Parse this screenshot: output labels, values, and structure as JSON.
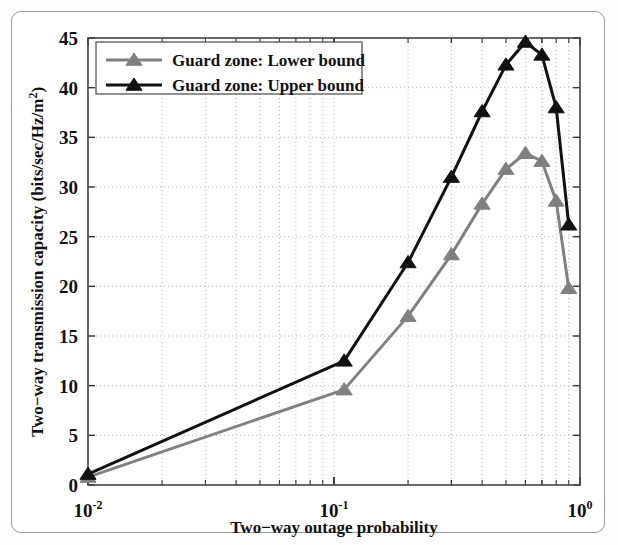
{
  "figure": {
    "frame_color": "#9a9a9a",
    "background": "#ffffff"
  },
  "chart_data": {
    "type": "line",
    "title": "",
    "xlabel": "Two−way outage probability",
    "ylabel": "Two−way transmission capacity (bits/sec/Hz/m²)",
    "xscale": "log",
    "yscale": "linear",
    "xlim": [
      0.01,
      1.0
    ],
    "ylim": [
      0,
      45
    ],
    "grid": true,
    "grid_style": "dotted",
    "legend_position": "upper-left",
    "xticks": [
      0.01,
      0.1,
      1.0
    ],
    "xticklabels": [
      "10⁻²",
      "10⁻¹",
      "10⁰"
    ],
    "xtick_bases": [
      "10",
      "10",
      "10"
    ],
    "xtick_exponents": [
      "-2",
      "-1",
      "0"
    ],
    "yticks": [
      0,
      5,
      10,
      15,
      20,
      25,
      30,
      35,
      40,
      45
    ],
    "yticklabels": [
      "0",
      "5",
      "10",
      "15",
      "20",
      "25",
      "30",
      "35",
      "40",
      "45"
    ],
    "marker": "triangle-up",
    "series": [
      {
        "name": "Guard zone: Lower bound",
        "color": "#808080",
        "linewidth": 3.0,
        "x": [
          0.01,
          0.11,
          0.2,
          0.3,
          0.4,
          0.5,
          0.6,
          0.7,
          0.8,
          0.9
        ],
        "y": [
          0.8,
          9.6,
          17.0,
          23.2,
          28.3,
          31.8,
          33.4,
          32.6,
          28.6,
          19.8
        ]
      },
      {
        "name": "Guard zone: Upper bound",
        "color": "#111111",
        "linewidth": 3.0,
        "x": [
          0.01,
          0.11,
          0.2,
          0.3,
          0.4,
          0.5,
          0.6,
          0.7,
          0.8,
          0.9
        ],
        "y": [
          1.1,
          12.5,
          22.4,
          31.0,
          37.6,
          42.3,
          44.6,
          43.3,
          38.0,
          26.2
        ]
      }
    ]
  },
  "legend": {
    "entries": [
      {
        "label": "Guard zone: Lower bound",
        "color": "#808080"
      },
      {
        "label": "Guard zone: Upper bound",
        "color": "#111111"
      }
    ]
  },
  "axes": {
    "x_title": "Two−way outage probability",
    "y_title": "Two−way transmission capacity (bits/sec/Hz/m",
    "y_title_sup": "2",
    "y_title_close": ")"
  }
}
